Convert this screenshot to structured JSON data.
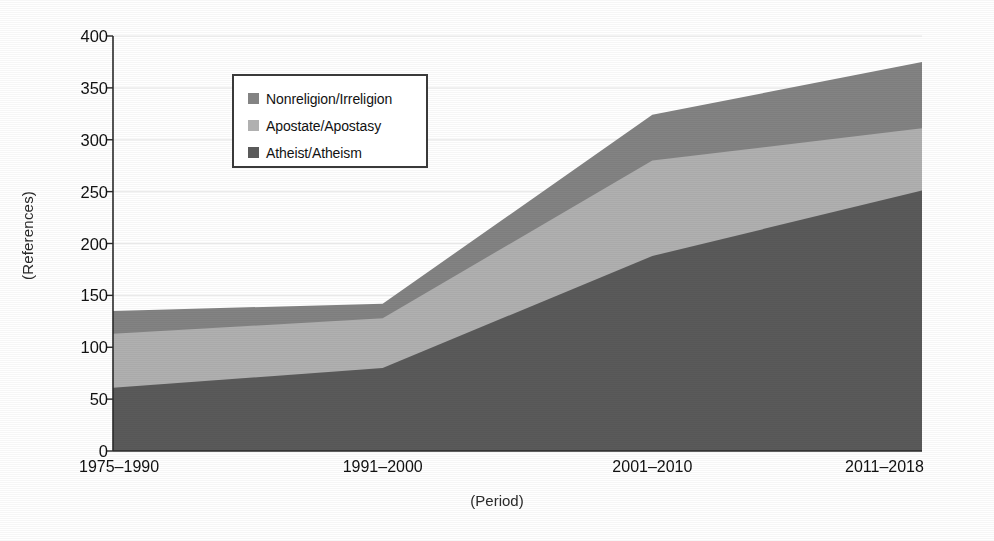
{
  "chart_data": {
    "type": "area",
    "stacked": true,
    "title": "",
    "subtitle": "",
    "xlabel": "(Period)",
    "ylabel": "(References)",
    "categories": [
      "1975–1990",
      "1991–2000",
      "2001–2010",
      "2011–2018"
    ],
    "series": [
      {
        "name": "Atheist/Atheism",
        "values": [
          61,
          80,
          188,
          251
        ],
        "color": "#5a5a5a",
        "stack_order": 1
      },
      {
        "name": "Apostate/Apostasy",
        "values": [
          52,
          48,
          92,
          60
        ],
        "color": "#b0b0b0",
        "stack_order": 2
      },
      {
        "name": "Nonreligion/Irreligion",
        "values": [
          22,
          14,
          44,
          64
        ],
        "color": "#838383",
        "stack_order": 3
      }
    ],
    "cumulative_tops": {
      "Atheist/Atheism": [
        61,
        80,
        188,
        251
      ],
      "Apostate/Apostasy": [
        113,
        128,
        280,
        311
      ],
      "Nonreligion/Irreligion": [
        135,
        142,
        324,
        375
      ]
    },
    "ylim": [
      0,
      400
    ],
    "xlim_categories": 4,
    "yticks": [
      0,
      50,
      100,
      150,
      200,
      250,
      300,
      350,
      400
    ],
    "ytick_labels": [
      "0",
      "50",
      "100",
      "150",
      "200",
      "250",
      "300",
      "350",
      "400"
    ],
    "grid": true,
    "grid_axis": "y",
    "legend_position": "upper-left-inside",
    "legend_entries": [
      {
        "label": "Nonreligion/Irreligion",
        "color": "#838383"
      },
      {
        "label": "Apostate/Apostasy",
        "color": "#b0b0b0"
      },
      {
        "label": "Atheist/Atheism",
        "color": "#5a5a5a"
      }
    ]
  },
  "axes": {
    "y_label": "(References)",
    "x_label": "(Period)"
  },
  "colors": {
    "background": "#ffffff",
    "axis_line": "#2b2b2b",
    "grid_line": "#e8e8e8",
    "text": "#111111",
    "legend_border": "#3a3a3a",
    "series_atheist": "#5a5a5a",
    "series_apostate": "#b0b0b0",
    "series_nonreligion": "#838383"
  }
}
